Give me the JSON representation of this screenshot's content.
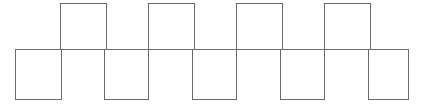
{
  "figure": {
    "canvas": {
      "width": 421,
      "height": 105,
      "background": "#ffffff"
    },
    "stroke": {
      "color": "#6b6b6b",
      "width": 1,
      "linejoin": "miter",
      "linecap": "butt"
    },
    "geometry": {
      "square_size": 46,
      "pitch": 88,
      "midline_y": 49,
      "top_row_y": 3,
      "bottom_row_y": 49,
      "strip_left_x": 15,
      "strip_right_x": 408
    },
    "midline": {
      "x1": 15,
      "y": 49,
      "x2": 408
    },
    "top_squares": [
      {
        "x": 60,
        "y": 3,
        "w": 46,
        "h": 46,
        "label": "top-square-1"
      },
      {
        "x": 148,
        "y": 3,
        "w": 46,
        "h": 46,
        "label": "top-square-2"
      },
      {
        "x": 236,
        "y": 3,
        "w": 46,
        "h": 46,
        "label": "top-square-3"
      },
      {
        "x": 324,
        "y": 3,
        "w": 46,
        "h": 46,
        "label": "top-square-4"
      }
    ],
    "bottom_squares": [
      {
        "x": 15,
        "y": 49,
        "w": 46,
        "h": 50,
        "label": "bottom-square-1"
      },
      {
        "x": 104,
        "y": 49,
        "w": 44,
        "h": 50,
        "label": "bottom-square-2"
      },
      {
        "x": 192,
        "y": 49,
        "w": 44,
        "h": 50,
        "label": "bottom-square-3"
      },
      {
        "x": 280,
        "y": 49,
        "w": 44,
        "h": 50,
        "label": "bottom-square-4"
      },
      {
        "x": 368,
        "y": 49,
        "w": 40,
        "h": 50,
        "label": "bottom-square-5"
      }
    ],
    "counts": {
      "top": 4,
      "bottom": 5,
      "total": 9
    }
  },
  "chart_data": {
    "type": "diagram",
    "series": [
      {
        "name": "top row (above midline)",
        "x_positions": [
          60,
          148,
          236,
          324
        ],
        "count": 4
      },
      {
        "name": "bottom row (below midline)",
        "x_positions": [
          15,
          104,
          192,
          280,
          368
        ],
        "count": 5
      }
    ],
    "square_side_px": 46,
    "period_px": 88,
    "xlim": [
      0,
      421
    ],
    "ylim": [
      0,
      105
    ],
    "grid": false,
    "legend": "none"
  }
}
